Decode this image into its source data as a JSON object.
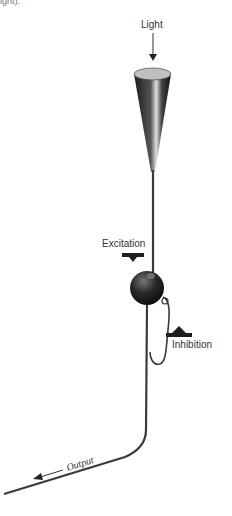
{
  "caption_fragment": "ight).",
  "labels": {
    "light": "Light",
    "excitation": "Excitation",
    "inhibition": "Inhibition",
    "output": "Output"
  },
  "colors": {
    "stroke": "#3a3a3a",
    "dark": "#1e1e1e",
    "highlight": "#d8d8d8"
  }
}
